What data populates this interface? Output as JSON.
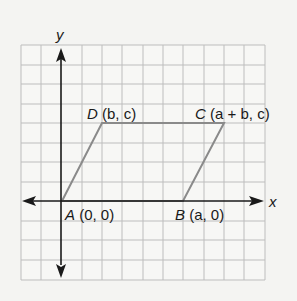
{
  "diagram": {
    "type": "coordinate-plane-parallelogram",
    "axes": {
      "x_label": "x",
      "y_label": "y"
    },
    "grid": {
      "columns": 12,
      "rows": 12,
      "line_color": "#b9b9b9",
      "background": "#f7f7f5"
    },
    "shape": {
      "name": "parallelogram ABCD",
      "stroke_color": "#8a8a8a"
    },
    "vertices": [
      {
        "id": "A",
        "label": "A",
        "coords": "(0, 0)"
      },
      {
        "id": "B",
        "label": "B",
        "coords": "(a, 0)"
      },
      {
        "id": "C",
        "label": "C",
        "coords": "(a + b, c)"
      },
      {
        "id": "D",
        "label": "D",
        "coords": "(b, c)"
      }
    ]
  }
}
